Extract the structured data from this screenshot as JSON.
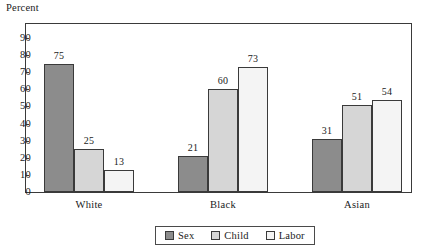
{
  "chart_data": {
    "type": "bar",
    "title": "",
    "ylabel": "Percent",
    "xlabel": "",
    "categories": [
      "White",
      "Black",
      "Asian"
    ],
    "series": [
      {
        "name": "Sex",
        "values": [
          75,
          21,
          31
        ],
        "color": "#8c8c8c"
      },
      {
        "name": "Child",
        "values": [
          25,
          60,
          51
        ],
        "color": "#d6d6d6"
      },
      {
        "name": "Labor",
        "values": [
          13,
          73,
          54
        ],
        "color": "#f4f4f4"
      }
    ],
    "ylim": [
      0,
      90
    ],
    "yticks": [
      0,
      10,
      20,
      30,
      40,
      50,
      60,
      70,
      80,
      90
    ],
    "ytick_labels": [
      "0",
      "10",
      "20",
      "30",
      "40",
      "50",
      "60",
      "70",
      "80",
      "90"
    ],
    "grid": false,
    "legend_position": "below-right",
    "value_labels": {
      "White": [
        "75",
        "25",
        "13"
      ],
      "Black": [
        "21",
        "60",
        "73"
      ],
      "Asian": [
        "31",
        "51",
        "54"
      ]
    }
  },
  "axis": {
    "y_title": "Percent",
    "ticks": [
      "90",
      "80",
      "70",
      "60",
      "50",
      "40",
      "30",
      "20",
      "10",
      "0"
    ],
    "category_labels": [
      "White",
      "Black",
      "Asian"
    ]
  },
  "legend": {
    "entries": [
      {
        "label": "Sex",
        "swatch_color": "#8c8c8c"
      },
      {
        "label": "Child",
        "swatch_color": "#d6d6d6"
      },
      {
        "label": "Labor",
        "swatch_color": "#f4f4f4"
      }
    ]
  },
  "bars": [
    {
      "group": "White",
      "series": "Sex",
      "value": "75"
    },
    {
      "group": "White",
      "series": "Child",
      "value": "25"
    },
    {
      "group": "White",
      "series": "Labor",
      "value": "13"
    },
    {
      "group": "Black",
      "series": "Sex",
      "value": "21"
    },
    {
      "group": "Black",
      "series": "Child",
      "value": "60"
    },
    {
      "group": "Black",
      "series": "Labor",
      "value": "73"
    },
    {
      "group": "Asian",
      "series": "Sex",
      "value": "31"
    },
    {
      "group": "Asian",
      "series": "Child",
      "value": "51"
    },
    {
      "group": "Asian",
      "series": "Labor",
      "value": "54"
    }
  ]
}
